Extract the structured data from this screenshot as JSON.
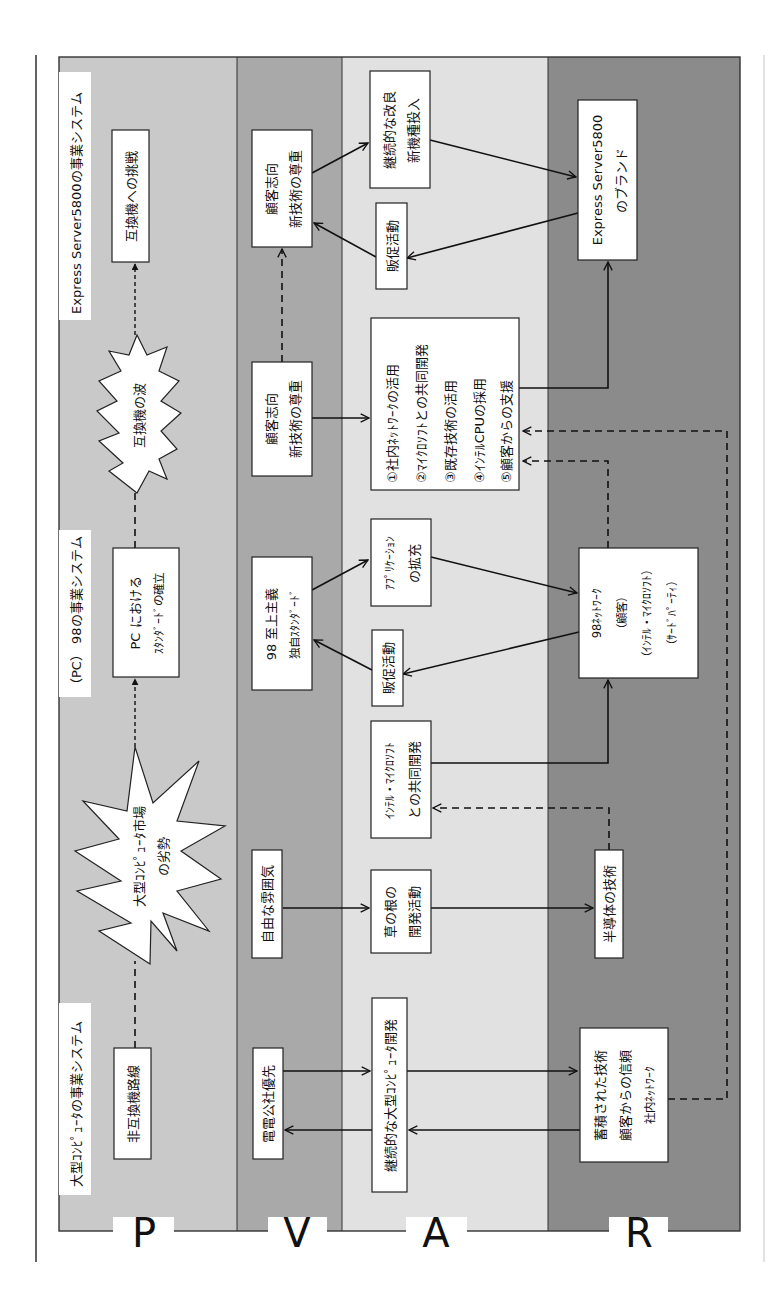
{
  "bands": [
    {
      "id": "P",
      "label": "P",
      "color": "#c9c9c9"
    },
    {
      "id": "V",
      "label": "V",
      "color": "#a9a9a9"
    },
    {
      "id": "A",
      "label": "A",
      "color": "#e1e1e1"
    },
    {
      "id": "R",
      "label": "R",
      "color": "#8b8b8b"
    }
  ],
  "phase_titles": {
    "mainframe": "大型ｺﾝﾋﾟｭｰﾀの事業システム",
    "pc98": "（PC） 98の事業システム",
    "express": "Express Server5800の事業システム"
  },
  "bursts": {
    "mainframe_decline": [
      "大型ｺﾝﾋﾟｭｰﾀ市場",
      "の劣勢"
    ],
    "compatible_wave": [
      "互換機の波"
    ]
  },
  "P": {
    "non_compatible": "非互換機路線",
    "pc_standard": [
      "PC における",
      "ｽﾀﾝﾀﾞｰﾄﾞの確立"
    ],
    "compatible_challenge": "互換機への挑戦"
  },
  "V": {
    "nttc_priority": "電電公社優先",
    "free_atmosphere": "自由な雰囲気",
    "pc98_supremacy": [
      "98 至上主義",
      "独自ｽﾀﾝﾀﾞｰﾄﾞ"
    ],
    "customer_orient_1": [
      "顧客志向",
      "新技術の尊重"
    ],
    "customer_orient_2": [
      "顧客志向",
      "新技術の尊重"
    ]
  },
  "A": {
    "continuous_mainframe_dev": "継続的な大型ｺﾝﾋﾟｭｰﾀ開発",
    "grassroots_dev": [
      "草の根の",
      "開発活動"
    ],
    "intel_ms_joint": [
      "ｲﾝﾃﾙ・ﾏｲｸﾛｿﾌﾄ",
      "との共同開発"
    ],
    "sales_promo_1": "販促活動",
    "app_expansion": [
      "ｱﾌﾟﾘｹｰｼｮﾝ",
      "の拡充"
    ],
    "strategy_list": [
      "①社内ﾈｯﾄﾜｰｸの活用",
      "②ﾏｲｸﾛｿﾌﾄとの共同開発",
      "③既存技術の活用",
      "④ｲﾝﾃﾙCPUの採用",
      "⑤顧客からの支援"
    ],
    "sales_promo_2": "販促活動",
    "continuous_improvement": [
      "継続的な改良",
      "新機種投入"
    ]
  },
  "R": {
    "accumulated": [
      "蓄積された技術",
      "顧客からの信頼",
      "社内ﾈｯﾄﾜｰｸ"
    ],
    "semiconductor": "半導体の技術",
    "network98": [
      "98ﾈｯﾄﾜｰｸ",
      "（顧客）",
      "（ｲﾝﾃﾙ・ﾏｲｸﾛｿﾌﾄ）",
      "（ｻｰﾄﾞﾊﾟｰﾃｨ）"
    ],
    "brand": [
      "Express Server5800",
      "のブランド"
    ]
  }
}
